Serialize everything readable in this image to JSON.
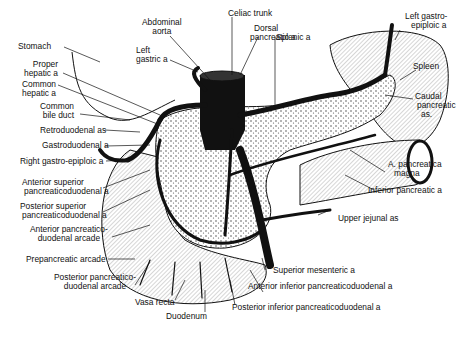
{
  "figure": {
    "colors": {
      "ink": "#111111",
      "background": "#ffffff",
      "shade": "#8a8a8a"
    }
  },
  "labels": {
    "stomach": [
      "Stomach"
    ],
    "abdominal_aorta": [
      "Abdominal",
      "aorta"
    ],
    "celiac_trunk": [
      "Celiac trunk"
    ],
    "left_gastric": [
      "Left",
      "gastric a"
    ],
    "dorsal_pancreatic": [
      "Dorsal",
      "pancreatic a"
    ],
    "splenic": [
      "Splenic a"
    ],
    "left_gastroepiploic": [
      "Left gastro-",
      "epiploic a"
    ],
    "spleen": [
      "Spleen"
    ],
    "caudal_pancreatic": [
      "Caudal",
      "pancreatic",
      "as."
    ],
    "proper_hepatic": [
      "Proper",
      "hepatic a"
    ],
    "common_hepatic": [
      "Common",
      "hepatic a"
    ],
    "common_bile_duct": [
      "Common",
      "bile duct"
    ],
    "retroduodenal": [
      "Retroduodenal as"
    ],
    "gastroduodenal": [
      "Gastroduodenal a"
    ],
    "right_gastroepiploic": [
      "Right gastro-epiploic a"
    ],
    "ant_sup_pd": [
      "Anterior superior",
      "pancreaticoduodenal a"
    ],
    "post_sup_pd": [
      "Posterior superior",
      "pancreaticoduodenal a"
    ],
    "ant_pd_arcade": [
      "Anterior pancreatico-",
      "duodenal arcade"
    ],
    "prepancreatic_arcade": [
      "Prepancreatic arcade"
    ],
    "post_pd_arcade": [
      "Posterior pancreatico-",
      "duodenal arcade"
    ],
    "vasa_recta": [
      "Vasa recta"
    ],
    "duodenum": [
      "Duodenum"
    ],
    "a_pancreatica_magna": [
      "A. pancreatica",
      "magna"
    ],
    "inferior_pancreatic": [
      "Inferior pancreatic a"
    ],
    "upper_jejunal": [
      "Upper jejunal as"
    ],
    "superior_mesenteric": [
      "Superior mesenteric a"
    ],
    "ant_inf_pd": [
      "Anterior inferior pancreaticoduodenal a"
    ],
    "post_inf_pd": [
      "Posterior inferior pancreaticoduodenal a"
    ]
  }
}
